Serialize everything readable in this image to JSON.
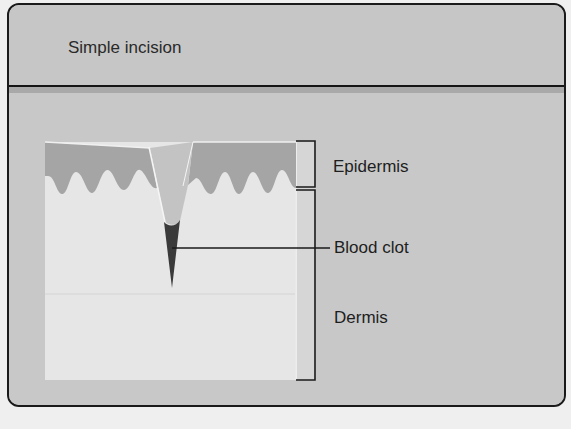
{
  "figure": {
    "title": "Simple incision",
    "labels": {
      "epidermis": "Epidermis",
      "blood_clot": "Blood clot",
      "dermis": "Dermis"
    },
    "colors": {
      "panel_bg": "#c4c4c4",
      "epidermis": "#a5a5a5",
      "dermis": "#e6e6e6",
      "blood_clot": "#3a3a3a",
      "outline": "#1a1a1a"
    }
  }
}
